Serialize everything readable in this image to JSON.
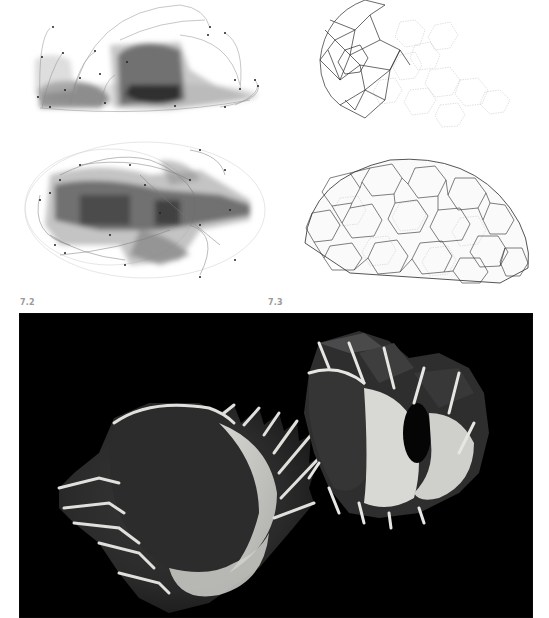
{
  "figures": [
    {
      "id": "7.2",
      "label": "7.2",
      "description": "Overlaid translucent grayscale renders of a skull/body form, side and top views, with curved connecting lines and node points",
      "views": [
        "side-view",
        "top-view"
      ]
    },
    {
      "id": "7.3",
      "label": "7.3",
      "description": "Wireframe polyhedral/hexagonal cellular mesh dome, partial (top) and complete (bottom)",
      "views": [
        "partial-mesh",
        "full-mesh"
      ]
    },
    {
      "id": "photo",
      "label": "",
      "description": "Black-background photograph of two pale sculpted cellular shell objects with spiny ridges"
    }
  ],
  "colors": {
    "background": "#ffffff",
    "label_text": "#9a9a9a",
    "photo_background": "#000000",
    "render_gray": "#3a3a3a",
    "mesh_line": "#333333"
  }
}
